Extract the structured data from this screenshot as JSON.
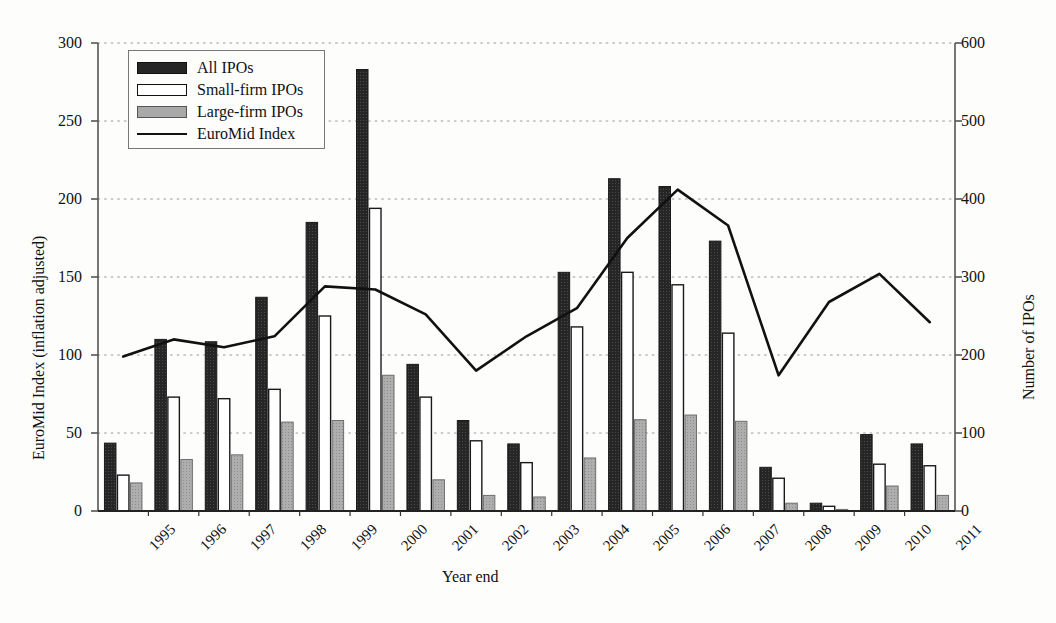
{
  "chart_data": {
    "type": "bar",
    "title": "",
    "subtitle": "",
    "xlabel": "Year end",
    "ylabel": "EuroMid Index (inflation adjusted)",
    "ylabel_right": "Number of IPOs",
    "grid": true,
    "legend_position": "top-left",
    "categories": [
      "1995",
      "1996",
      "1997",
      "1998",
      "1999",
      "2000",
      "2001",
      "2002",
      "2003",
      "2004",
      "2005",
      "2006",
      "2007",
      "2008",
      "2009",
      "2010",
      "2011"
    ],
    "ylim_left": [
      0,
      300
    ],
    "yticks_left": [
      "0",
      "50",
      "100",
      "150",
      "200",
      "250",
      "300"
    ],
    "ylim_right": [
      0,
      600
    ],
    "yticks_right": [
      "0",
      "100",
      "200",
      "300",
      "400",
      "500",
      "600"
    ],
    "series": [
      {
        "name": "All IPOs",
        "kind": "bar",
        "axis": "right",
        "color": "#262626",
        "values": [
          87,
          220,
          217,
          274,
          370,
          566,
          188,
          116,
          86,
          306,
          426,
          416,
          346,
          56,
          10,
          98,
          86
        ]
      },
      {
        "name": "Small-firm IPOs",
        "kind": "bar",
        "axis": "right",
        "color": "#ffffff",
        "values": [
          46,
          146,
          144,
          156,
          250,
          388,
          146,
          90,
          62,
          236,
          306,
          290,
          228,
          42,
          6,
          60,
          58
        ]
      },
      {
        "name": "Large-firm IPOs",
        "kind": "bar",
        "axis": "right",
        "color": "#a9a9a9",
        "values": [
          36,
          66,
          72,
          114,
          116,
          174,
          40,
          20,
          18,
          68,
          117,
          123,
          115,
          10,
          2,
          32,
          20
        ]
      },
      {
        "name": "EuroMid Index",
        "kind": "line",
        "axis": "left",
        "color": "#111111",
        "values": [
          99,
          110,
          105,
          112,
          144,
          142,
          126,
          90,
          112,
          130,
          175,
          206,
          183,
          87,
          134,
          152,
          121
        ]
      }
    ]
  },
  "legend": {
    "entries": [
      {
        "label": "All IPOs",
        "swatch": "dark-bar-swatch"
      },
      {
        "label": "Small-firm IPOs",
        "swatch": "white-bar-swatch"
      },
      {
        "label": "Large-firm IPOs",
        "swatch": "gray-bar-swatch"
      },
      {
        "label": "EuroMid Index",
        "swatch": "line-swatch"
      }
    ]
  },
  "colors": {
    "all_ipos": "#262626",
    "small_firm_ipos": "#ffffff",
    "large_firm_ipos": "#a9a9a9",
    "euromid_line": "#111111",
    "axis": "#555555",
    "grid": "#999999",
    "background": "#fdfdfc"
  }
}
